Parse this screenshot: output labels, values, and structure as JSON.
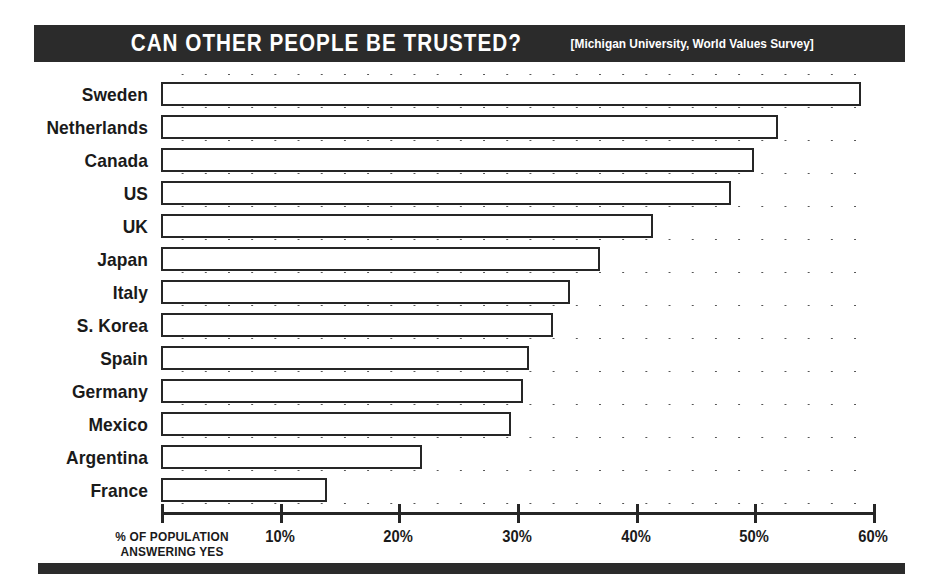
{
  "header": {
    "title": "CAN OTHER PEOPLE BE TRUSTED?",
    "source": "[Michigan University, World Values Survey]"
  },
  "axis_caption": {
    "line1": "% OF POPULATION",
    "line2": "ANSWERING YES"
  },
  "colors": {
    "title_bar": "#2b2b2b",
    "bar_outline": "#262626",
    "bar_fill": "#ffffff",
    "background": "#ffffff",
    "text": "#1a1a1a"
  },
  "chart_data": {
    "type": "bar",
    "orientation": "horizontal",
    "title": "CAN OTHER PEOPLE BE TRUSTED?",
    "subtitle": "[Michigan University, World Values Survey]",
    "xlabel": "% OF POPULATION ANSWERING YES",
    "ylabel": "",
    "xlim": [
      0,
      60
    ],
    "xticks": [
      10,
      20,
      30,
      40,
      50,
      60
    ],
    "xtick_labels": [
      "10%",
      "20%",
      "30%",
      "40%",
      "50%",
      "60%"
    ],
    "grid": false,
    "legend": "none",
    "categories": [
      "Sweden",
      "Netherlands",
      "Canada",
      "US",
      "UK",
      "Japan",
      "Italy",
      "S. Korea",
      "Spain",
      "Germany",
      "Mexico",
      "Argentina",
      "France"
    ],
    "values": [
      59,
      52,
      50,
      48,
      41.5,
      37,
      34.5,
      33,
      31,
      30.5,
      29.5,
      22,
      14
    ],
    "value_labels": [
      "59%",
      "52%",
      "50%",
      "48%",
      "41.5%",
      "37%",
      "34.5%",
      "33%",
      "31%",
      "30.5%",
      "29.5%",
      "22%",
      "14%"
    ]
  }
}
